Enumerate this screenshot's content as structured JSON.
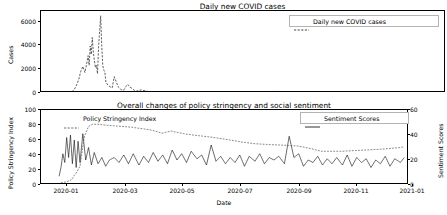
{
  "figure": {
    "background": "#ffffff",
    "line_color": "#1a1a1a",
    "width": 447,
    "height": 215
  },
  "panels": [
    {
      "id": "covid-cases",
      "title": "Daily new COVID cases",
      "ylabel": "Cases",
      "xlabel": "",
      "yticks": [
        "0",
        "2000",
        "4000",
        "6000"
      ],
      "xticks": [],
      "legend": [
        {
          "label": "Daily new COVID cases",
          "style": "dashed"
        }
      ]
    },
    {
      "id": "policy-sentiment",
      "title": "Overall changes of policy stringency and social sentiment",
      "ylabel": "Policy Stringency Index",
      "ylabel_right": "Sentiment Scores",
      "xlabel": "Date",
      "yticks": [
        "0",
        "20",
        "40",
        "60",
        "80",
        "100"
      ],
      "yticks_right": [
        "0",
        "20",
        "40",
        "60"
      ],
      "xticks": [
        "2020-01",
        "2020-03",
        "2020-05",
        "2020-07",
        "2020-09",
        "2020-11",
        "2021-01"
      ],
      "legend_left": [
        {
          "label": "Policy Stringency Index",
          "style": "dashed"
        }
      ],
      "legend_right": [
        {
          "label": "Sentiment Scores",
          "style": "solid"
        }
      ]
    }
  ],
  "chart_data": [
    {
      "type": "line",
      "id": "covid-cases",
      "title": "Daily new COVID cases",
      "xlabel": "",
      "ylabel": "Cases",
      "ylim": [
        0,
        6800
      ],
      "xlim": [
        "2019-12-20",
        "2021-01-10"
      ],
      "grid": false,
      "legend_position": "upper right",
      "series": [
        {
          "name": "Daily new COVID cases",
          "style": "dashed",
          "color": "#1a1a1a",
          "x": [
            "2019-12-22",
            "2019-12-29",
            "2020-01-05",
            "2020-01-12",
            "2020-01-16",
            "2020-01-19",
            "2020-01-21",
            "2020-01-23",
            "2020-01-25",
            "2020-01-27",
            "2020-01-29",
            "2020-01-31",
            "2020-02-02",
            "2020-02-03",
            "2020-02-04",
            "2020-02-05",
            "2020-02-06",
            "2020-02-07",
            "2020-02-08",
            "2020-02-09",
            "2020-02-10",
            "2020-02-11",
            "2020-02-12",
            "2020-02-13",
            "2020-02-14",
            "2020-02-15",
            "2020-02-16",
            "2020-02-17",
            "2020-02-18",
            "2020-02-19",
            "2020-02-20",
            "2020-02-22",
            "2020-02-24",
            "2020-02-26",
            "2020-02-28",
            "2020-03-01",
            "2020-03-03",
            "2020-03-05",
            "2020-03-08",
            "2020-03-12",
            "2020-03-16",
            "2020-03-20",
            "2020-03-25",
            "2020-04-01",
            "2020-04-10",
            "2020-04-20",
            "2020-05-01",
            "2020-05-15",
            "2020-06-01",
            "2020-06-15",
            "2020-06-30",
            "2020-07-15",
            "2020-07-31",
            "2020-08-15",
            "2020-08-31",
            "2020-09-15",
            "2020-09-30",
            "2020-10-15",
            "2020-10-31",
            "2020-11-15",
            "2020-11-30",
            "2020-12-15",
            "2020-12-31",
            "2021-01-05"
          ],
          "y": [
            5,
            5,
            10,
            20,
            60,
            140,
            320,
            660,
            1100,
            1800,
            2200,
            1700,
            2600,
            3100,
            2300,
            3900,
            3200,
            4600,
            3400,
            2700,
            2100,
            2300,
            1600,
            3800,
            5100,
            6400,
            4000,
            2300,
            1900,
            1750,
            900,
            650,
            520,
            430,
            1350,
            900,
            480,
            320,
            220,
            700,
            380,
            150,
            260,
            120,
            90,
            70,
            60,
            55,
            60,
            70,
            95,
            120,
            130,
            115,
            100,
            95,
            90,
            80,
            75,
            70,
            65,
            60,
            55,
            50
          ]
        }
      ]
    },
    {
      "type": "line",
      "id": "policy-sentiment",
      "title": "Overall changes of policy stringency and social sentiment",
      "xlabel": "Date",
      "ylabel": "Policy Stringency Index",
      "ylabel_right": "Sentiment Scores",
      "ylim": [
        0,
        100
      ],
      "ylim_right": [
        0,
        60
      ],
      "xlim": [
        "2019-12-20",
        "2021-01-10"
      ],
      "grid": false,
      "xticks": [
        "2020-01",
        "2020-03",
        "2020-05",
        "2020-07",
        "2020-09",
        "2020-11",
        "2021-01"
      ],
      "series": [
        {
          "name": "Policy Stringency Index",
          "axis": "left",
          "style": "dashed",
          "color": "#4d4d4d",
          "x": [
            "2020-01-10",
            "2020-01-15",
            "2020-01-20",
            "2020-01-23",
            "2020-01-26",
            "2020-01-30",
            "2020-02-03",
            "2020-02-08",
            "2020-02-12",
            "2020-02-18",
            "2020-02-25",
            "2020-03-05",
            "2020-03-15",
            "2020-03-25",
            "2020-04-05",
            "2020-04-15",
            "2020-04-25",
            "2020-05-05",
            "2020-05-12",
            "2020-05-20",
            "2020-06-01",
            "2020-06-15",
            "2020-07-01",
            "2020-07-15",
            "2020-08-01",
            "2020-08-15",
            "2020-09-01",
            "2020-09-15",
            "2020-10-01",
            "2020-10-10",
            "2020-10-20",
            "2020-11-01",
            "2020-11-15",
            "2020-12-01",
            "2020-12-15",
            "2021-01-01",
            "2021-01-05"
          ],
          "y": [
            3,
            4,
            6,
            10,
            16,
            25,
            60,
            78,
            81,
            81,
            80,
            79,
            78,
            77,
            75,
            73,
            69,
            72,
            70,
            68,
            66,
            64,
            61,
            58,
            55,
            54,
            53,
            52,
            48,
            45,
            45,
            45,
            46,
            47,
            48,
            50,
            51
          ]
        },
        {
          "name": "Sentiment Scores",
          "axis": "right",
          "style": "solid",
          "color": "#1a1a1a",
          "x": [
            "2020-01-08",
            "2020-01-10",
            "2020-01-12",
            "2020-01-14",
            "2020-01-16",
            "2020-01-18",
            "2020-01-20",
            "2020-01-22",
            "2020-01-24",
            "2020-01-26",
            "2020-01-28",
            "2020-01-30",
            "2020-02-02",
            "2020-02-05",
            "2020-02-08",
            "2020-02-11",
            "2020-02-14",
            "2020-02-18",
            "2020-02-22",
            "2020-02-26",
            "2020-03-01",
            "2020-03-06",
            "2020-03-11",
            "2020-03-16",
            "2020-03-21",
            "2020-03-26",
            "2020-04-01",
            "2020-04-06",
            "2020-04-11",
            "2020-04-16",
            "2020-04-21",
            "2020-04-26",
            "2020-05-01",
            "2020-05-06",
            "2020-05-11",
            "2020-05-16",
            "2020-05-21",
            "2020-05-26",
            "2020-06-01",
            "2020-06-06",
            "2020-06-11",
            "2020-06-16",
            "2020-06-21",
            "2020-06-26",
            "2020-07-01",
            "2020-07-06",
            "2020-07-11",
            "2020-07-16",
            "2020-07-21",
            "2020-07-26",
            "2020-08-01",
            "2020-08-06",
            "2020-08-11",
            "2020-08-16",
            "2020-08-21",
            "2020-08-26",
            "2020-09-01",
            "2020-09-06",
            "2020-09-11",
            "2020-09-16",
            "2020-09-21",
            "2020-09-26",
            "2020-10-01",
            "2020-10-06",
            "2020-10-11",
            "2020-10-16",
            "2020-10-21",
            "2020-10-26",
            "2020-11-01",
            "2020-11-06",
            "2020-11-11",
            "2020-11-16",
            "2020-11-21",
            "2020-11-26",
            "2020-12-01",
            "2020-12-06",
            "2020-12-11",
            "2020-12-16",
            "2020-12-21",
            "2020-12-26",
            "2021-01-01",
            "2021-01-05"
          ],
          "y": [
            7,
            14,
            25,
            18,
            38,
            22,
            40,
            17,
            36,
            14,
            35,
            18,
            41,
            20,
            30,
            16,
            26,
            17,
            22,
            15,
            20,
            22,
            18,
            24,
            17,
            25,
            16,
            23,
            18,
            26,
            19,
            24,
            17,
            28,
            20,
            25,
            18,
            27,
            21,
            24,
            16,
            32,
            19,
            23,
            17,
            22,
            18,
            24,
            15,
            23,
            19,
            25,
            17,
            22,
            20,
            23,
            17,
            39,
            22,
            25,
            15,
            20,
            18,
            23,
            16,
            21,
            17,
            22,
            16,
            24,
            15,
            22,
            18,
            21,
            14,
            20,
            17,
            23,
            15,
            21,
            18,
            22
          ]
        }
      ]
    }
  ]
}
